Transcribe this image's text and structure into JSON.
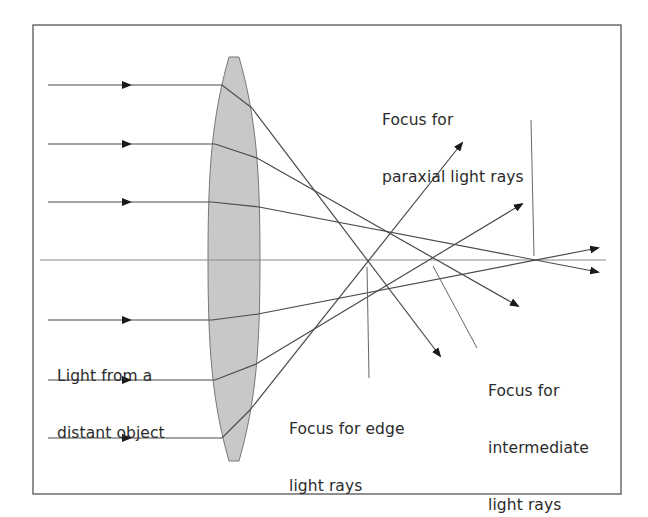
{
  "diagram": {
    "frame": {
      "x": 33,
      "y": 25,
      "width": 588,
      "height": 469,
      "stroke": "#555555"
    },
    "lens": {
      "fill": "#c8c8c8",
      "stroke": "#777777",
      "top_y": 57,
      "bottom_y": 461,
      "center_x": 234,
      "half_width": 26
    },
    "optical_axis": {
      "y": 260,
      "x1": 40,
      "x2": 606,
      "stroke": "#888888"
    },
    "rays": [
      {
        "id": "ray-1",
        "y_in": 85,
        "enter": [
          222,
          85
        ],
        "exit": [
          252,
          108
        ],
        "end": [
          440,
          356
        ],
        "focus_group": "edge"
      },
      {
        "id": "ray-2",
        "y_in": 144,
        "enter": [
          215,
          144
        ],
        "exit": [
          257,
          158
        ],
        "end": [
          518,
          306
        ],
        "focus_group": "intermediate"
      },
      {
        "id": "ray-3",
        "y_in": 202,
        "enter": [
          212,
          202
        ],
        "exit": [
          259,
          207
        ],
        "end": [
          598,
          272
        ],
        "focus_group": "paraxial"
      },
      {
        "id": "ray-4",
        "y_in": 320,
        "enter": [
          212,
          320
        ],
        "exit": [
          258,
          314
        ],
        "end": [
          598,
          248
        ],
        "focus_group": "paraxial"
      },
      {
        "id": "ray-5",
        "y_in": 380,
        "enter": [
          215,
          380
        ],
        "exit": [
          256,
          364
        ],
        "end": [
          522,
          204
        ],
        "focus_group": "intermediate"
      },
      {
        "id": "ray-6",
        "y_in": 438,
        "enter": [
          222,
          438
        ],
        "exit": [
          250,
          410
        ],
        "end": [
          462,
          143
        ],
        "focus_group": "edge"
      }
    ],
    "ray_start_x": 48,
    "input_arrow_x": 130,
    "ray_color": "#4a4a4a",
    "arrow_color": "#1a1a1a",
    "leaders": [
      {
        "id": "leader-paraxial",
        "x1": 531,
        "y1": 120,
        "x2": 534,
        "y2": 256
      },
      {
        "id": "leader-edge",
        "x1": 367,
        "y1": 267,
        "x2": 369,
        "y2": 378
      },
      {
        "id": "leader-intermediate",
        "x1": 433,
        "y1": 266,
        "x2": 477,
        "y2": 348
      }
    ],
    "labels": {
      "paraxial": {
        "line1": "Focus for",
        "line2": "paraxial light rays"
      },
      "light_source": {
        "line1": "Light from a",
        "line2": "distant object"
      },
      "edge": {
        "line1": "Focus for edge",
        "line2": "light rays"
      },
      "intermediate": {
        "line1": "Focus for",
        "line2": "intermediate",
        "line3": "light rays"
      }
    }
  }
}
